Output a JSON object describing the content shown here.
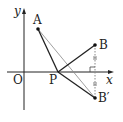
{
  "diagram": {
    "axes": {
      "x_label": "x",
      "y_label": "y",
      "origin_label": "O"
    },
    "points": {
      "A": {
        "label": "A",
        "x": 38,
        "y": 29
      },
      "B": {
        "label": "B",
        "x": 95,
        "y": 45
      },
      "B_prime": {
        "label": "B′",
        "x": 95,
        "y": 98
      },
      "P": {
        "label": "P",
        "x": 58,
        "y": 72
      }
    },
    "segments": [
      "A-P",
      "P-B",
      "P-B′",
      "A-B′",
      "B-B′ (dotted, perpendicular to x-axis)"
    ],
    "colors": {
      "stroke": "#222222",
      "thin": "#777777"
    }
  }
}
